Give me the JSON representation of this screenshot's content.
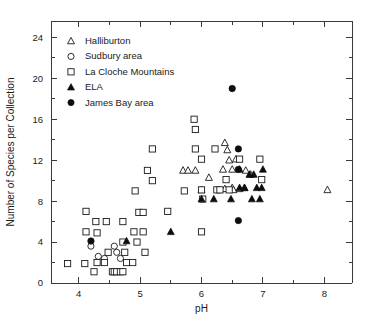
{
  "chart_data": {
    "type": "scatter",
    "title": "",
    "xlabel": "pH",
    "ylabel": "Number of Species per Collection",
    "xlim": [
      3.55,
      8.45
    ],
    "ylim": [
      0,
      25.6
    ],
    "xticks": [
      4,
      5,
      6,
      7,
      8
    ],
    "xtick_labels": [
      "4",
      "5",
      "6",
      "7",
      "8"
    ],
    "xminor_step": 0.5,
    "yticks": [
      0,
      4,
      8,
      12,
      16,
      20,
      24
    ],
    "ytick_labels": [
      "0",
      "4",
      "8",
      "12",
      "16",
      "20",
      "24"
    ],
    "yminor_step": 2,
    "grid": false,
    "legend_position": "upper-left",
    "series": [
      {
        "name": "Halliburton",
        "marker": "triangle-open",
        "filled": false,
        "points": [
          [
            5.7,
            11
          ],
          [
            5.78,
            11
          ],
          [
            5.9,
            11
          ],
          [
            6.12,
            10.3
          ],
          [
            6.0,
            9.1
          ],
          [
            6.38,
            13.7
          ],
          [
            6.42,
            13.0
          ],
          [
            6.45,
            12.0
          ],
          [
            6.56,
            12.1
          ],
          [
            6.35,
            11.1
          ],
          [
            6.5,
            11.1
          ],
          [
            6.72,
            11.0
          ],
          [
            6.8,
            10.6
          ],
          [
            6.38,
            9.2
          ],
          [
            6.5,
            9.3
          ],
          [
            6.52,
            9.1
          ],
          [
            6.62,
            9.2
          ],
          [
            6.7,
            9.3
          ],
          [
            8.05,
            9.1
          ]
        ]
      },
      {
        "name": "Sudbury area",
        "marker": "circle-open",
        "filled": false,
        "points": [
          [
            4.2,
            3.6
          ],
          [
            4.32,
            2.6
          ],
          [
            4.42,
            2.4
          ],
          [
            4.58,
            3.6
          ],
          [
            4.62,
            3.0
          ],
          [
            4.68,
            2.4
          ]
        ]
      },
      {
        "name": "La Cloche Mountains",
        "marker": "square-open",
        "filled": false,
        "points": [
          [
            3.82,
            1.9
          ],
          [
            4.1,
            1.9
          ],
          [
            4.12,
            7.0
          ],
          [
            4.12,
            5.0
          ],
          [
            4.28,
            6.0
          ],
          [
            4.3,
            4.9
          ],
          [
            4.3,
            2.0
          ],
          [
            4.42,
            2.0
          ],
          [
            4.45,
            6.0
          ],
          [
            4.48,
            3.0
          ],
          [
            4.55,
            1.1
          ],
          [
            4.58,
            1.1
          ],
          [
            4.62,
            1.1
          ],
          [
            4.68,
            1.1
          ],
          [
            4.72,
            1.1
          ],
          [
            4.25,
            1.1
          ],
          [
            4.72,
            6.0
          ],
          [
            4.72,
            4.0
          ],
          [
            4.75,
            3.0
          ],
          [
            4.78,
            2.0
          ],
          [
            4.88,
            2.0
          ],
          [
            4.9,
            5.0
          ],
          [
            4.92,
            9.0
          ],
          [
            4.95,
            4.0
          ],
          [
            4.98,
            6.9
          ],
          [
            5.05,
            6.9
          ],
          [
            5.05,
            5.0
          ],
          [
            5.08,
            3.0
          ],
          [
            5.12,
            11.0
          ],
          [
            5.2,
            13.1
          ],
          [
            5.2,
            10.0
          ],
          [
            5.45,
            7.0
          ],
          [
            5.72,
            9.0
          ],
          [
            5.88,
            16.0
          ],
          [
            5.9,
            15.0
          ],
          [
            5.9,
            13.1
          ],
          [
            6.0,
            12.1
          ],
          [
            6.0,
            9.1
          ],
          [
            6.02,
            8.2
          ],
          [
            6.0,
            5.0
          ],
          [
            6.22,
            13.1
          ],
          [
            6.25,
            9.1
          ],
          [
            6.3,
            9.1
          ],
          [
            6.4,
            10.1
          ],
          [
            6.45,
            9.1
          ],
          [
            6.62,
            12.1
          ],
          [
            6.95,
            12.1
          ],
          [
            6.98,
            10.1
          ]
        ]
      },
      {
        "name": "ELA",
        "marker": "triangle-filled",
        "filled": true,
        "points": [
          [
            4.78,
            4.1
          ],
          [
            5.5,
            5.0
          ],
          [
            6.0,
            8.2
          ],
          [
            6.2,
            8.2
          ],
          [
            6.48,
            8.2
          ],
          [
            6.62,
            11.1
          ],
          [
            6.62,
            9.3
          ],
          [
            6.7,
            9.3
          ],
          [
            6.78,
            10.6
          ],
          [
            6.85,
            10.6
          ],
          [
            6.9,
            9.3
          ],
          [
            6.98,
            9.3
          ],
          [
            6.82,
            8.2
          ],
          [
            6.95,
            8.2
          ],
          [
            7.0,
            11.1
          ]
        ]
      },
      {
        "name": "James Bay area",
        "marker": "circle-filled",
        "filled": true,
        "points": [
          [
            4.2,
            4.1
          ],
          [
            6.5,
            19.0
          ],
          [
            6.6,
            13.1
          ],
          [
            6.6,
            11.1
          ],
          [
            6.6,
            6.1
          ]
        ]
      }
    ]
  },
  "legend": {
    "entries": [
      {
        "label": "Halliburton",
        "marker": "triangle-open"
      },
      {
        "label": "Sudbury area",
        "marker": "circle-open"
      },
      {
        "label": "La Cloche Mountains",
        "marker": "square-open"
      },
      {
        "label": "ELA",
        "marker": "triangle-filled"
      },
      {
        "label": "James Bay area",
        "marker": "circle-filled"
      }
    ]
  },
  "colors": {
    "axis": "#3a3a3a",
    "marker_stroke": "#1a1a1a",
    "marker_fill_open": "#ffffff",
    "marker_fill_solid": "#0d0d0d",
    "background": "#ffffff"
  }
}
